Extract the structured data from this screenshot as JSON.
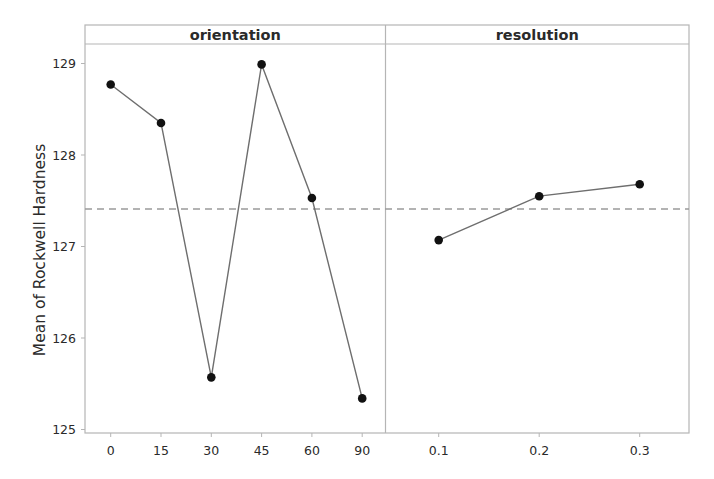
{
  "chart_data": {
    "type": "line",
    "title": "",
    "ylabel": "Mean of Rockwell Hardness",
    "ylim": [
      124.95,
      129.2
    ],
    "yticks": [
      125,
      126,
      127,
      128,
      129
    ],
    "ytick_labels": [
      "125",
      "126",
      "127",
      "128",
      "129"
    ],
    "grand_mean": 127.41,
    "grid": false,
    "legend": null,
    "panels": [
      {
        "name": "orientation",
        "xlabel": "",
        "categories": [
          "0",
          "15",
          "30",
          "45",
          "60",
          "90"
        ],
        "values": [
          128.77,
          128.35,
          125.57,
          128.99,
          127.53,
          125.34
        ]
      },
      {
        "name": "resolution",
        "xlabel": "",
        "categories": [
          "0.1",
          "0.2",
          "0.3"
        ],
        "values": [
          127.07,
          127.55,
          127.68
        ]
      }
    ]
  },
  "colors": {
    "frame": "#b5b5b5",
    "line": "#6e6e6e",
    "marker": "#111111",
    "mean_line": "#9a9a9a",
    "text": "#2a2a2a"
  }
}
